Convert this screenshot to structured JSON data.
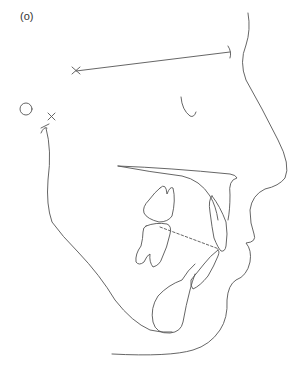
{
  "figure": {
    "panel_label": "(o)",
    "stroke_color": "#555555",
    "background_color": "#ffffff"
  },
  "elements": {
    "sella": {
      "shape": "circle",
      "label": ""
    },
    "porion_marks": [
      "cross",
      "cross"
    ],
    "reference_line": {
      "style": "solid",
      "start_mark": "cross",
      "end_mark": "tick"
    },
    "occlusal_line": {
      "style": "dashed"
    },
    "structures": [
      "soft-tissue-profile",
      "orbit-curve",
      "palatal-plane",
      "upper-molar",
      "lower-molar",
      "upper-incisor",
      "lower-incisor",
      "mandible-outline",
      "symphysis",
      "ramus"
    ]
  }
}
